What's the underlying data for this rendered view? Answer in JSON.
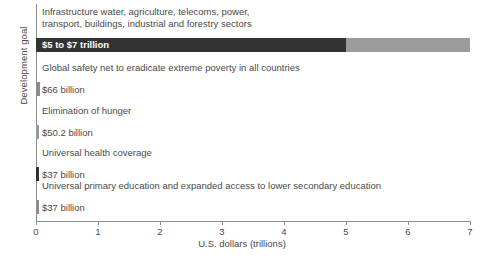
{
  "chart_data": {
    "type": "bar",
    "orientation": "horizontal",
    "title": "",
    "xlabel": "U.S. dollars (trillions)",
    "ylabel": "Development goal",
    "xlim": [
      0,
      7
    ],
    "xticks": [
      "0",
      "1",
      "2",
      "3",
      "4",
      "5",
      "6",
      "7"
    ],
    "grid": false,
    "legend": false,
    "categories": [
      "Infrastructure water, agriculture, telecoms, power,\ntransport, buildings, industrial and forestry sectors",
      "Global safety net to eradicate extreme poverty in all countries",
      "Elimination of hunger",
      "Universal health coverage",
      "Universal primary education and expanded access to lower secondary education"
    ],
    "values": [
      5.0,
      0.066,
      0.0502,
      0.037,
      0.037
    ],
    "value_high": [
      7.0,
      null,
      null,
      null,
      null
    ],
    "value_labels": [
      "$5 to $7 trillion",
      "$66 billion",
      "$50.2 billion",
      "$37 billion",
      "$37 billion"
    ],
    "bar_colors": [
      "#333333",
      "#8c8c8c",
      "#9a9a9a",
      "#333333",
      "#8c8c8c"
    ],
    "range_color": "#9b9b9b",
    "axis_color": "#8d8d8d",
    "text_color": "#4a4a4a",
    "background": "#ffffff"
  }
}
